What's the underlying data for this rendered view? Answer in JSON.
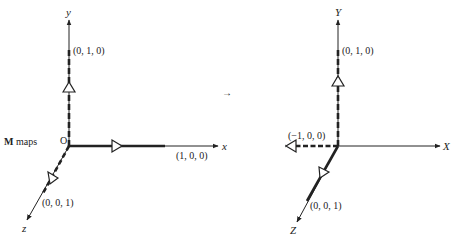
{
  "diagram": {
    "caption_prefix_bold": "M",
    "caption_rest": " maps",
    "maps_arrow": "→",
    "left": {
      "origin_label": "O",
      "axis_x_label": "x",
      "axis_y_label": "y",
      "axis_z_label": "z",
      "point_x": "(1, 0, 0)",
      "point_y": "(0, 1, 0)",
      "point_z": "(0, 0, 1)"
    },
    "right": {
      "axis_x_label": "X",
      "axis_y_label": "Y",
      "axis_z_label": "Z",
      "point_neg_x": "(−1, 0, 0)",
      "point_y": "(0, 1, 0)",
      "point_z": "(0, 0, 1)"
    },
    "colors": {
      "ink": "#222222",
      "background": "#ffffff"
    }
  }
}
